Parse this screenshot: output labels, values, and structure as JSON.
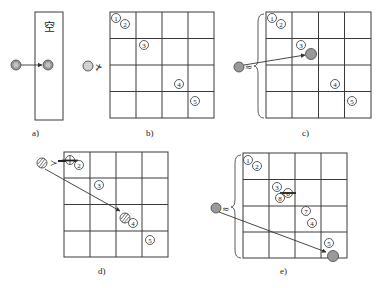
{
  "figure": {
    "caption_faint": "",
    "panels": [
      {
        "id": "a",
        "label": "a)",
        "box_text": "空",
        "relation_symbol": "≻",
        "description": "Single ball moved into an empty bin"
      },
      {
        "id": "b",
        "label": "b)",
        "relation_symbol": "⊁",
        "grid": {
          "rows": 4,
          "cols": 4
        },
        "markers": [
          "①",
          "②",
          "③",
          "④",
          "⑤"
        ]
      },
      {
        "id": "c",
        "label": "c)",
        "relation_symbol": "≈",
        "grid": {
          "rows": 4,
          "cols": 4
        },
        "markers": [
          "①",
          "②",
          "③",
          "④",
          "⑤"
        ]
      },
      {
        "id": "d",
        "label": "d)",
        "relation_symbol": "≻",
        "grid": {
          "rows": 4,
          "cols": 4
        },
        "markers": [
          "①",
          "②",
          "③",
          "④",
          "⑤"
        ]
      },
      {
        "id": "e",
        "label": "e)",
        "relation_symbol": "≈",
        "grid": {
          "rows": 4,
          "cols": 4
        },
        "markers": [
          "①",
          "②",
          "③",
          "⑥",
          "⑧",
          "⑦",
          "④",
          "⑤"
        ]
      }
    ],
    "colors": {
      "line": "#3a3a3a",
      "ball_fill": "#9a9a9a",
      "background": "#ffffff"
    }
  }
}
